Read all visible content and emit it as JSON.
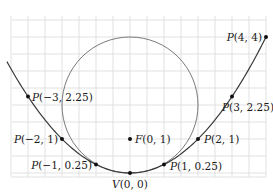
{
  "figure": {
    "type": "parabola-with-circle",
    "equation": "y = x^2 / 4",
    "scale_px_per_unit": 34,
    "origin_px": [
      130,
      173
    ],
    "grid": {
      "step_px": 17,
      "x_range_px": [
        12,
        266
      ],
      "y_range_px": [
        20,
        177
      ],
      "color": "#d9d9d9"
    },
    "curve": {
      "color": "#3a3a3a",
      "x_range": [
        -3.62,
        4.0
      ]
    },
    "circle": {
      "center": [
        0,
        2
      ],
      "radius": 2,
      "color": "#7a7a7a"
    },
    "points": [
      {
        "id": "p-4-4",
        "x": 4,
        "y": 4,
        "label": "P(4, 4)",
        "name_part": "P",
        "coords_part": "(4, 4)",
        "anchor": "end",
        "dx": -4,
        "dy": 4
      },
      {
        "id": "p-3-2.25",
        "x": 3,
        "y": 2.25,
        "label": "P(3, 2.25)",
        "name_part": "P",
        "coords_part": "(3, 2.25)",
        "anchor": "start",
        "dx": -10,
        "dy": 14
      },
      {
        "id": "p-2-1",
        "x": 2,
        "y": 1,
        "label": "P(2, 1)",
        "name_part": "P",
        "coords_part": "(2, 1)",
        "anchor": "start",
        "dx": 6,
        "dy": 4
      },
      {
        "id": "p-1-0.25",
        "x": 1,
        "y": 0.25,
        "label": "P(1, 0.25)",
        "name_part": "P",
        "coords_part": "(1, 0.25)",
        "anchor": "start",
        "dx": 6,
        "dy": 5
      },
      {
        "id": "v-0-0",
        "x": 0,
        "y": 0,
        "label": "V(0, 0)",
        "name_part": "V",
        "coords_part": "(0, 0)",
        "anchor": "middle",
        "dx": 0,
        "dy": 15
      },
      {
        "id": "f-0-1",
        "x": 0,
        "y": 1,
        "label": "F(0, 1)",
        "name_part": "F",
        "coords_part": "(0, 1)",
        "anchor": "start",
        "dx": 5,
        "dy": 4
      },
      {
        "id": "p-neg1-0.25",
        "x": -1,
        "y": 0.25,
        "label": "P(−1, 0.25)",
        "name_part": "P",
        "coords_part": "(−1, 0.25)",
        "anchor": "end",
        "dx": -4,
        "dy": 4
      },
      {
        "id": "p-neg2-1",
        "x": -2,
        "y": 1,
        "label": "P(−2, 1)",
        "name_part": "P",
        "coords_part": "(−2, 1)",
        "anchor": "end",
        "dx": -4,
        "dy": 4
      },
      {
        "id": "p-neg3-2.25",
        "x": -3,
        "y": 2.25,
        "label": "P(−3, 2.25)",
        "name_part": "P",
        "coords_part": "(−3, 2.25)",
        "anchor": "start",
        "dx": 4,
        "dy": 4
      }
    ],
    "point_color": "#111111"
  }
}
